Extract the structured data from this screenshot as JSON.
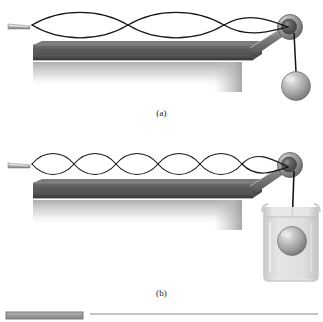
{
  "figure": {
    "background_color": "#ffffff",
    "width": 323,
    "height": 322
  },
  "colors": {
    "string": "#15151a",
    "table_top": "#5d5d5d",
    "table_edge_dark": "#3c3c3c",
    "table_highlight": "#8a8a8a",
    "shadow": "#b9b9b9",
    "sphere_light": "#e2e2e2",
    "sphere_mid": "#a9a9a9",
    "sphere_dark": "#6e6e6e",
    "pulley_rim": "#9a9a9a",
    "pulley_hub": "#555555",
    "beaker_glass": "#d2d2d2",
    "beaker_liquid": "#dcdcdc",
    "bottom_bar": "#9a9a9a",
    "rule_line": "#8d8d8d",
    "caption_text": "#1a1a1a"
  },
  "panels": [
    {
      "id": "a",
      "caption": "(a)",
      "harmonic_loops": 2,
      "wave": {
        "x_start": 32,
        "x_end": 288,
        "centerline_y": 25,
        "amplitude": 10,
        "nodes": 3,
        "antinodes": 2
      },
      "mass_medium": "air",
      "description": "Mass hangs freely in air; string vibrates in its second harmonic with two loops."
    },
    {
      "id": "b",
      "caption": "(b)",
      "harmonic_loops": 5,
      "wave": {
        "x_start": 32,
        "x_end": 288,
        "centerline_y": 164,
        "amplitude": 9,
        "nodes": 6,
        "antinodes": 5
      },
      "mass_medium": "liquid",
      "description": "Mass is submerged in a beaker of liquid; buoyancy lowers the tension so the string vibrates in its fifth harmonic with five loops."
    }
  ],
  "components": {
    "vibrator": "vibrator-tip",
    "table": "lab-bench",
    "pulley": "pulley-wheel",
    "hanging_mass": "spherical-mass",
    "beaker": "liquid-beaker",
    "support_rod": "pulley-support-rod",
    "string": "vibrating-string"
  },
  "footer": {
    "swatch_label": "",
    "rule_label": ""
  }
}
